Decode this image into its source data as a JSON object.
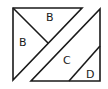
{
  "diagram": {
    "type": "tangram-style square dissection",
    "pieces": [
      {
        "id": "left-triangle",
        "points": [
          [
            13,
            8
          ],
          [
            82,
            8
          ],
          [
            13,
            80
          ]
        ]
      },
      {
        "id": "right-triangle",
        "points": [
          [
            100,
            9
          ],
          [
            100,
            81
          ],
          [
            31,
            81
          ]
        ]
      }
    ],
    "dividers": [
      {
        "id": "b-divider",
        "from": [
          13,
          8
        ],
        "to": [
          48,
          43
        ]
      },
      {
        "id": "d-divider",
        "from": [
          100,
          46
        ],
        "to": [
          69,
          81
        ]
      }
    ],
    "labels": [
      {
        "id": "label-b-top",
        "text": "B",
        "x": 46,
        "y": 21
      },
      {
        "id": "label-b-left",
        "text": "B",
        "x": 19,
        "y": 46
      },
      {
        "id": "label-c",
        "text": "C",
        "x": 63,
        "y": 64
      },
      {
        "id": "label-d",
        "text": "D",
        "x": 86,
        "y": 78
      }
    ],
    "stroke_color": "#1a1a1a",
    "background": "#ffffff"
  }
}
